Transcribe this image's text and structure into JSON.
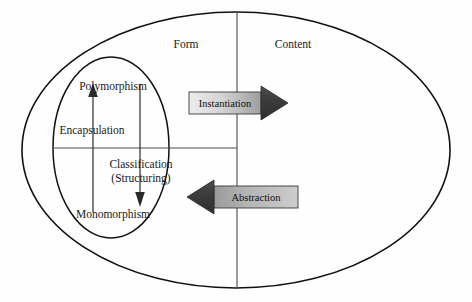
{
  "diagram": {
    "regions": {
      "form_label": "Form",
      "content_label": "Content"
    },
    "inner_quadrant_labels": {
      "top": "Polymorphism",
      "bottom": "Monomorphism",
      "left": "Encapsulation",
      "right_line1": "Classification",
      "right_line2": "(Structuring)"
    },
    "arrows": {
      "instantiation": {
        "label": "Instantiation",
        "direction": "right",
        "body_color_light": "#e8e8e8",
        "body_color_dark": "#a8a8a8",
        "head_color": "#3d3d3d"
      },
      "abstraction": {
        "label": "Abstraction",
        "direction": "left",
        "body_color_light": "#c2c2c2",
        "body_color_dark": "#8f8f8f",
        "head_color": "#3d3d3d"
      }
    },
    "colors": {
      "background": "#fefefe",
      "stroke": "#111111",
      "divider": "#4a4a4a"
    }
  }
}
